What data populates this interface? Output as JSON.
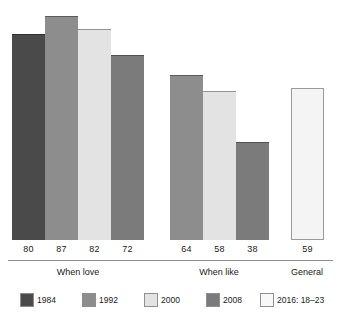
{
  "chart_data": {
    "type": "bar",
    "title": "",
    "subtitle": "",
    "xlabel": "",
    "ylabel": "",
    "ylim": [
      0,
      90
    ],
    "grid": false,
    "legend_position": "bottom",
    "categories": [
      "When love",
      "When like",
      "General"
    ],
    "series": [
      {
        "name": "1984",
        "color": "#4a4a4a",
        "values": [
          80,
          null,
          null
        ]
      },
      {
        "name": "1992",
        "color": "#8d8d8d",
        "values": [
          87,
          64,
          null
        ]
      },
      {
        "name": "2000",
        "color": "#e3e3e3",
        "values": [
          82,
          58,
          null
        ]
      },
      {
        "name": "2008",
        "color": "#7b7b7b",
        "values": [
          72,
          38,
          null
        ]
      },
      {
        "name": "2016: 18–23",
        "color": "#f4f4f4",
        "values": [
          null,
          null,
          59
        ]
      }
    ],
    "bars": [
      {
        "group": "When love",
        "series": "1984",
        "value": 80,
        "label": "80",
        "color": "#4a4a4a",
        "x": 12,
        "width": 33
      },
      {
        "group": "When love",
        "series": "1992",
        "value": 87,
        "label": "87",
        "color": "#8d8d8d",
        "x": 45,
        "width": 33
      },
      {
        "group": "When love",
        "series": "2000",
        "value": 82,
        "label": "82",
        "color": "#e3e3e3",
        "x": 78,
        "width": 33
      },
      {
        "group": "When love",
        "series": "2008",
        "value": 72,
        "label": "72",
        "color": "#7b7b7b",
        "x": 111,
        "width": 33
      },
      {
        "group": "When like",
        "series": "1992",
        "value": 64,
        "label": "64",
        "color": "#8d8d8d",
        "x": 170,
        "width": 33
      },
      {
        "group": "When like",
        "series": "2000",
        "value": 58,
        "label": "58",
        "color": "#e3e3e3",
        "x": 203,
        "width": 33
      },
      {
        "group": "When like",
        "series": "2008",
        "value": 38,
        "label": "38",
        "color": "#7b7b7b",
        "x": 236,
        "width": 33
      },
      {
        "group": "General",
        "series": "2016: 18–23",
        "value": 59,
        "label": "59",
        "color": "#f4f4f4",
        "x": 291,
        "width": 33
      }
    ],
    "group_labels": [
      {
        "text": "When love",
        "center": 78
      },
      {
        "text": "When like",
        "center": 219
      },
      {
        "text": "General",
        "center": 307
      }
    ],
    "legend_entries": [
      {
        "label": "1984",
        "color": "#4a4a4a",
        "x": 20
      },
      {
        "label": "1992",
        "color": "#8d8d8d",
        "x": 82
      },
      {
        "label": "2000",
        "color": "#e3e3e3",
        "x": 144
      },
      {
        "label": "2008",
        "color": "#7b7b7b",
        "x": 206
      },
      {
        "label": "2016: 18–23",
        "color": "#f8f8f8",
        "x": 260
      }
    ]
  },
  "axis": {
    "baseline_color": "#8c8c8c"
  }
}
